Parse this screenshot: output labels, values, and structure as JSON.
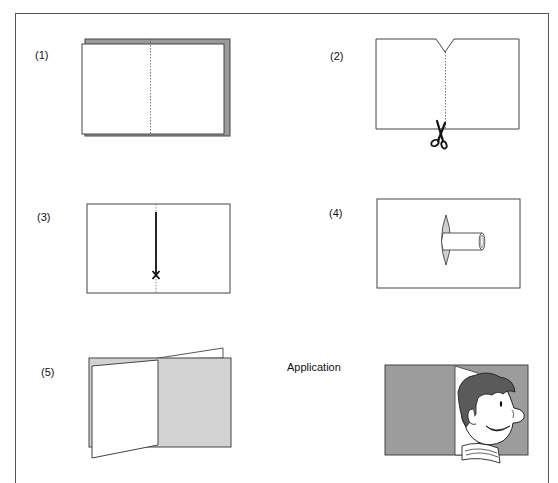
{
  "diagram": {
    "type": "instructional-craft-steps",
    "colors": {
      "frame": "#555555",
      "line": "#333333",
      "paper": "#ffffff",
      "dark_gray": "#9a9a9a",
      "light_gray": "#cfcfcf",
      "hair": "#5a5a5a"
    },
    "steps": [
      {
        "label": "(1)",
        "description": "Two sheets stacked, dotted center fold line"
      },
      {
        "label": "(2)",
        "description": "V-notch cut at top, cut along dotted line with scissors"
      },
      {
        "label": "(3)",
        "description": "Cut line down the center ending at X"
      },
      {
        "label": "(4)",
        "description": "Rolled tab pushed through slit"
      },
      {
        "label": "(5)",
        "description": "Card folded open showing door flap"
      }
    ],
    "application": {
      "label": "Application",
      "description": "Cartoon face peeking out of an opened door flap"
    }
  }
}
